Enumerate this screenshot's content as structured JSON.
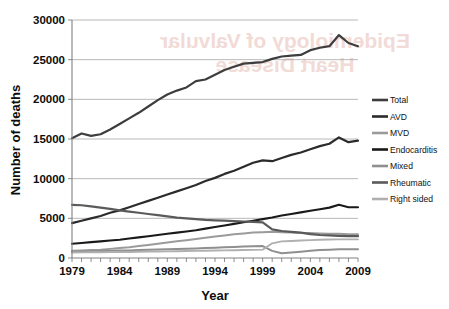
{
  "watermark": {
    "line1": "Epidemiology of Valvular",
    "line2": "Heart Disease"
  },
  "chart_data": {
    "type": "line",
    "title": "",
    "xlabel": "Year",
    "ylabel": "Number of deaths",
    "xlim": [
      1979,
      2009
    ],
    "ylim": [
      0,
      30000
    ],
    "ytick_values": [
      0,
      5000,
      10000,
      15000,
      20000,
      25000,
      30000
    ],
    "ytick_labels": [
      "0",
      "5000",
      "10000",
      "15000",
      "20000",
      "25000",
      "30000"
    ],
    "xtick_values": [
      1979,
      1984,
      1989,
      1994,
      1999,
      2004,
      2009
    ],
    "xtick_labels": [
      "1979",
      "1984",
      "1989",
      "1994",
      "1999",
      "2004",
      "2009"
    ],
    "grid": "horizontal",
    "legend_position": "right",
    "x": [
      1979,
      1980,
      1981,
      1982,
      1983,
      1984,
      1985,
      1986,
      1987,
      1988,
      1989,
      1990,
      1991,
      1992,
      1993,
      1994,
      1995,
      1996,
      1997,
      1998,
      1999,
      2000,
      2001,
      2002,
      2003,
      2004,
      2005,
      2006,
      2007,
      2008,
      2009
    ],
    "series": [
      {
        "name": "Total",
        "color": "#3d3d3d",
        "width": 2.2,
        "values": [
          15100,
          15700,
          15400,
          15600,
          16200,
          16900,
          17600,
          18300,
          19100,
          19900,
          20600,
          21100,
          21500,
          22300,
          22500,
          23100,
          23700,
          24100,
          24500,
          24600,
          24700,
          25100,
          25400,
          25500,
          25600,
          26200,
          26500,
          26700,
          28100,
          27100,
          26700
        ]
      },
      {
        "name": "AVD",
        "color": "#2b2b2b",
        "width": 2.2,
        "values": [
          4400,
          4700,
          5000,
          5300,
          5700,
          6000,
          6400,
          6800,
          7200,
          7600,
          8000,
          8400,
          8800,
          9200,
          9700,
          10100,
          10600,
          11000,
          11500,
          12000,
          12300,
          12200,
          12600,
          13000,
          13300,
          13700,
          14100,
          14400,
          15200,
          14600,
          14800
        ]
      },
      {
        "name": "MVD",
        "color": "#9b9b9b",
        "width": 2.0,
        "values": [
          900,
          950,
          1000,
          1050,
          1150,
          1250,
          1350,
          1500,
          1650,
          1800,
          1950,
          2100,
          2250,
          2400,
          2550,
          2700,
          2850,
          3000,
          3100,
          3200,
          3250,
          3300,
          3250,
          3200,
          3150,
          3150,
          3100,
          3050,
          3050,
          3000,
          3000
        ]
      },
      {
        "name": "Endocarditis",
        "color": "#1a1a1a",
        "width": 2.1,
        "values": [
          1800,
          1900,
          2000,
          2100,
          2200,
          2300,
          2450,
          2600,
          2750,
          2900,
          3050,
          3200,
          3350,
          3500,
          3700,
          3900,
          4100,
          4300,
          4500,
          4700,
          4900,
          5100,
          5350,
          5550,
          5750,
          5950,
          6150,
          6350,
          6700,
          6400,
          6400
        ]
      },
      {
        "name": "Mixed",
        "color": "#8f8f8f",
        "width": 2.0,
        "values": [
          800,
          820,
          850,
          880,
          900,
          930,
          960,
          1000,
          1030,
          1060,
          1100,
          1130,
          1160,
          1200,
          1250,
          1300,
          1350,
          1400,
          1450,
          1480,
          1500,
          900,
          600,
          700,
          800,
          900,
          1000,
          1050,
          1100,
          1100,
          1100
        ]
      },
      {
        "name": "Rheumatic",
        "color": "#5a5a5a",
        "width": 2.2,
        "values": [
          6700,
          6650,
          6500,
          6350,
          6200,
          6000,
          5850,
          5700,
          5550,
          5400,
          5250,
          5100,
          5000,
          4900,
          4800,
          4750,
          4700,
          4650,
          4600,
          4550,
          4500,
          3600,
          3400,
          3300,
          3200,
          3000,
          2900,
          2850,
          2800,
          2750,
          2750
        ]
      },
      {
        "name": "Right sided",
        "color": "#b0b0b0",
        "width": 1.9,
        "values": [
          700,
          710,
          720,
          730,
          740,
          750,
          760,
          780,
          800,
          820,
          840,
          860,
          880,
          900,
          920,
          940,
          960,
          980,
          1000,
          1020,
          1050,
          1850,
          2100,
          2150,
          2200,
          2250,
          2300,
          2330,
          2350,
          2350,
          2350
        ]
      }
    ]
  },
  "legend": {
    "items": [
      {
        "label": "Total",
        "color": "#3d3d3d"
      },
      {
        "label": "AVD",
        "color": "#2b2b2b"
      },
      {
        "label": "MVD",
        "color": "#9b9b9b"
      },
      {
        "label": "Endocarditis",
        "color": "#1a1a1a"
      },
      {
        "label": "Mixed",
        "color": "#8f8f8f"
      },
      {
        "label": "Rheumatic",
        "color": "#5a5a5a"
      },
      {
        "label": "Right sided",
        "color": "#b0b0b0"
      }
    ]
  }
}
